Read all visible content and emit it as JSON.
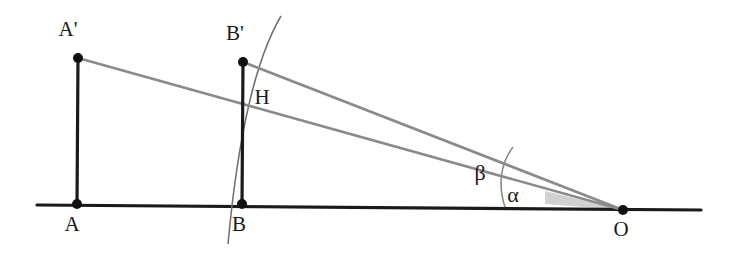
{
  "diagram": {
    "background_color": "#ffffff",
    "baseline_color": "#1a1a1a",
    "segment_color": "#1a1a1a",
    "ray_color": "#8a8a8a",
    "arc_color": "#6f6f6f",
    "shaded_wedge_color": "#c9c9c9",
    "point_color": "#111111",
    "labels": {
      "a_prime": "A'",
      "a": "A",
      "b_prime": "B'",
      "b": "B",
      "h": "H",
      "o": "O",
      "alpha": "α",
      "beta": "β"
    },
    "points": [
      {
        "name": "A'",
        "x": 78,
        "y": 58,
        "label_x": 68,
        "label_y": 36
      },
      {
        "name": "A",
        "x": 77,
        "y": 203,
        "label_x": 69,
        "label_y": 231
      },
      {
        "name": "B'",
        "x": 243,
        "y": 62,
        "label_x": 233,
        "label_y": 40
      },
      {
        "name": "B",
        "x": 242,
        "y": 203,
        "label_x": 234,
        "label_y": 231
      },
      {
        "name": "H",
        "x": 244,
        "y": 90,
        "label_x": 255,
        "label_y": 103
      },
      {
        "name": "O",
        "x": 623,
        "y": 210,
        "label_x": 615,
        "label_y": 236
      }
    ],
    "angle_labels": [
      {
        "name": "β",
        "x": 479,
        "y": 179
      },
      {
        "name": "α",
        "x": 509,
        "y": 201
      }
    ],
    "baseline": {
      "x1": 37,
      "y1": 205,
      "x2": 701,
      "y2": 210
    },
    "vertical_segments": [
      {
        "name": "AA'",
        "x1": 78,
        "y1": 58,
        "x2": 77,
        "y2": 205
      },
      {
        "name": "BB'",
        "x1": 243,
        "y1": 62,
        "x2": 242,
        "y2": 204
      }
    ],
    "rays": [
      {
        "name": "ray-A-prime-to-O",
        "x1": 78,
        "y1": 58,
        "x2": 623,
        "y2": 210
      },
      {
        "name": "ray-B-prime-to-O",
        "x1": 243,
        "y1": 62,
        "x2": 623,
        "y2": 210
      }
    ],
    "circle_arc": {
      "name": "arc-through-H-centered-at-O",
      "description": "circular arc centered at O passing through H and crossing the baseline near B",
      "start_x": 281,
      "start_y": 16,
      "end_x": 228,
      "end_y": 244,
      "radius": 393
    },
    "angle_arc": {
      "name": "angle-arc-at-O",
      "description": "small arc near O spanning alpha and beta",
      "start_x": 506,
      "start_y": 206,
      "end_x": 513,
      "end_y": 148,
      "radius": 120
    },
    "shaded_wedge": {
      "name": "alpha-wedge-shading",
      "apex_x": 623,
      "apex_y": 210,
      "base_left_x": 545,
      "base_left_y": 204,
      "top_left_x": 545,
      "top_left_y": 191
    }
  }
}
